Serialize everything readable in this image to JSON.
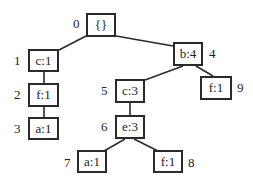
{
  "diagram": {
    "type": "fp-tree",
    "nodes": [
      {
        "id": "0",
        "label": "{}",
        "index_label": "0"
      },
      {
        "id": "1",
        "label": "c:1",
        "index_label": "1"
      },
      {
        "id": "2",
        "label": "f:1",
        "index_label": "2"
      },
      {
        "id": "3",
        "label": "a:1",
        "index_label": "3"
      },
      {
        "id": "4",
        "label": "b:4",
        "index_label": "4"
      },
      {
        "id": "5",
        "label": "c:3",
        "index_label": "5"
      },
      {
        "id": "6",
        "label": "e:3",
        "index_label": "6"
      },
      {
        "id": "7",
        "label": "a:1",
        "index_label": "7"
      },
      {
        "id": "8",
        "label": "f:1",
        "index_label": "8"
      },
      {
        "id": "9",
        "label": "f:1",
        "index_label": "9"
      }
    ],
    "edges": [
      [
        "0",
        "1"
      ],
      [
        "1",
        "2"
      ],
      [
        "2",
        "3"
      ],
      [
        "0",
        "4"
      ],
      [
        "4",
        "5"
      ],
      [
        "5",
        "6"
      ],
      [
        "6",
        "7"
      ],
      [
        "6",
        "8"
      ],
      [
        "4",
        "9"
      ]
    ]
  }
}
